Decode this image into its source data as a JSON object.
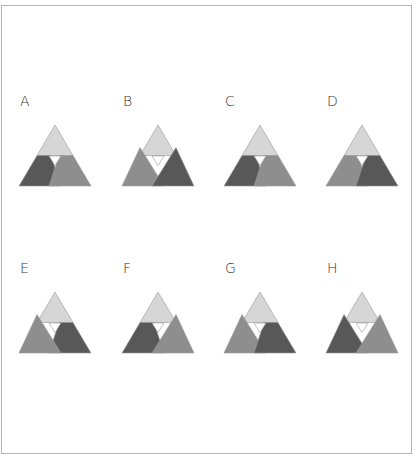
{
  "colors": {
    "light": "#d6d6d6",
    "mid": "#8e8e8e",
    "dark": "#585858",
    "stroke": "#9a9a9a",
    "gap": "#ffffff"
  },
  "options": [
    {
      "label": "A",
      "left": "dark",
      "right": "mid",
      "left_shape": "trap",
      "right_shape": "trap",
      "front": "right"
    },
    {
      "label": "B",
      "left": "mid",
      "right": "dark",
      "left_shape": "full",
      "right_shape": "full",
      "front": "right"
    },
    {
      "label": "C",
      "left": "dark",
      "right": "mid",
      "left_shape": "trap",
      "right_shape": "trap",
      "front": "right"
    },
    {
      "label": "D",
      "left": "mid",
      "right": "dark",
      "left_shape": "trap",
      "right_shape": "trap",
      "front": "right"
    },
    {
      "label": "E",
      "left": "mid",
      "right": "dark",
      "left_shape": "full",
      "right_shape": "trap",
      "front": "left"
    },
    {
      "label": "F",
      "left": "dark",
      "right": "mid",
      "left_shape": "trap",
      "right_shape": "full",
      "front": "right"
    },
    {
      "label": "G",
      "left": "mid",
      "right": "dark",
      "left_shape": "full",
      "right_shape": "trap",
      "front": "right"
    },
    {
      "label": "H",
      "left": "dark",
      "right": "mid",
      "left_shape": "full",
      "right_shape": "full",
      "front": "right"
    }
  ]
}
